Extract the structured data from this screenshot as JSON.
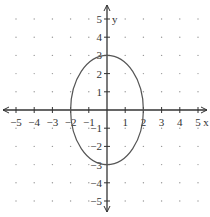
{
  "chart_data": {
    "type": "line",
    "title": "",
    "xlabel": "x",
    "ylabel": "y",
    "xlim": [
      -5,
      5
    ],
    "ylim": [
      -5,
      5
    ],
    "grid": "dotted",
    "x_ticks": [
      -5,
      -4,
      -3,
      -2,
      -1,
      1,
      2,
      3,
      4,
      5
    ],
    "y_ticks": [
      -5,
      -4,
      -3,
      -2,
      -1,
      1,
      2,
      3,
      4,
      5
    ],
    "series": [
      {
        "name": "ellipse",
        "equation": "x^2/4 + y^2/9 = 1",
        "center": [
          0,
          0
        ],
        "semi_axis_x": 2,
        "semi_axis_y": 3
      }
    ]
  },
  "labels": {
    "x_axis": "x",
    "y_axis": "y"
  },
  "colors": {
    "axis": "#333333",
    "curve": "#555555",
    "grid_dot": "#999999"
  }
}
